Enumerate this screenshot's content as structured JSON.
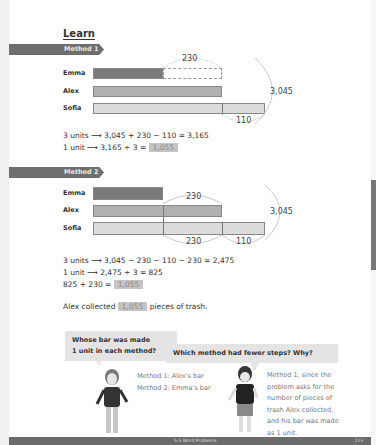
{
  "section_title": "Learn",
  "methods": [
    {
      "label": "Method 1",
      "names": [
        "Emma",
        "Alex",
        "Sofia"
      ],
      "labels": {
        "top": "230",
        "right": "3,045",
        "bottom": "110"
      },
      "steps": [
        {
          "text": "3 units ⟶ 3,045 + 230 − 110 = 3,165"
        },
        {
          "text": "1 unit ⟶ 3,165 ÷ 3 = ",
          "answer": "1,055"
        }
      ]
    },
    {
      "label": "Method 2",
      "names": [
        "Emma",
        "Alex",
        "Sofia"
      ],
      "labels": {
        "top": "230",
        "right": "3,045",
        "bottom_left": "230",
        "bottom_right": "110"
      },
      "steps": [
        {
          "text": "3 units ⟶ 3,045 − 230 − 110 − 230 = 2,475"
        },
        {
          "text": "1 unit ⟶ 2,475 ÷ 3 = 825"
        },
        {
          "text": "825 + 230 = ",
          "answer": "1,055"
        }
      ]
    }
  ],
  "conclusion": {
    "before": "Alex collected",
    "answer": "1,055",
    "after": "pieces of trash."
  },
  "discussion": [
    {
      "question_line1": "Whose bar was made",
      "question_line2": "1 unit in each method?",
      "answer_lines": [
        "Method 1: Alex's bar",
        "Method 2: Emma's bar"
      ]
    },
    {
      "question_line1": "Which method had fewer steps? Why?",
      "answer_lines": [
        "Method 1, since the",
        "problem asks for the",
        "number of pieces of",
        "trash Alex collected,",
        "and his bar was made",
        "as 1 unit."
      ]
    }
  ],
  "footer": {
    "section": "5-5 Word Problems",
    "page": "123"
  },
  "colors": {
    "banner": "#6e6e6e",
    "emma_bar": "#7a7a7a",
    "alex_bar": "#b0b0b0",
    "sofia_bar": "#dcdcdc",
    "answer_box": "#c4c4c4"
  }
}
